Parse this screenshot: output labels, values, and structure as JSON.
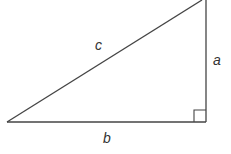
{
  "diagram": {
    "type": "right-triangle",
    "labels": {
      "hypotenuse": "c",
      "vertical_leg": "a",
      "horizontal_leg": "b"
    },
    "right_angle_marker": true,
    "stroke_color": "#444444"
  }
}
